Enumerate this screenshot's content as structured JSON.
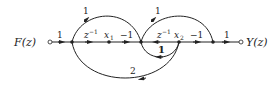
{
  "diagram": {
    "type": "signal-flow-graph",
    "input_label": "F(z)",
    "output_label": "Y(z)",
    "nodes": [
      {
        "id": "in",
        "x": 50,
        "label": "F(z)"
      },
      {
        "id": "n1",
        "x": 72,
        "label": ""
      },
      {
        "id": "x1",
        "x": 109,
        "label": "x1"
      },
      {
        "id": "n2",
        "x": 141,
        "label": ""
      },
      {
        "id": "x2",
        "x": 179,
        "label": "x2"
      },
      {
        "id": "n3",
        "x": 213,
        "label": ""
      },
      {
        "id": "out",
        "x": 241,
        "label": "Y(z)"
      }
    ],
    "branches": [
      {
        "from": "in",
        "to": "n1",
        "gain": "1"
      },
      {
        "from": "n1",
        "to": "x1",
        "gain": "z^-1"
      },
      {
        "from": "x1",
        "to": "n2",
        "gain": "-1"
      },
      {
        "from": "n2",
        "to": "x2",
        "gain": "z^-1"
      },
      {
        "from": "x2",
        "to": "n3",
        "gain": "-1"
      },
      {
        "from": "n3",
        "to": "out",
        "gain": "1"
      },
      {
        "from": "n1",
        "to": "n2",
        "gain": "1",
        "path": "upper arc"
      },
      {
        "from": "n2",
        "to": "n3",
        "gain": "1",
        "path": "upper arc"
      },
      {
        "from": "x2",
        "to": "n2",
        "gain": "1",
        "path": "lower loop"
      },
      {
        "from": "x2",
        "to": "n1",
        "gain": "2",
        "path": "lower wide arc"
      }
    ],
    "labels": {
      "in_gain": "1",
      "g_z1_a": "z",
      "g_z1_a_exp": "−1",
      "x1": "x",
      "x1_sub": "1",
      "g_m1_a": "−1",
      "g_z1_b": "z",
      "g_z1_b_exp": "−1",
      "x2": "x",
      "x2_sub": "2",
      "g_m1_b": "−1",
      "out_gain": "1",
      "arc1": "1",
      "arc2": "1",
      "loop": "1",
      "wide": "2",
      "input": "F(z)",
      "output": "Y(z)"
    }
  }
}
